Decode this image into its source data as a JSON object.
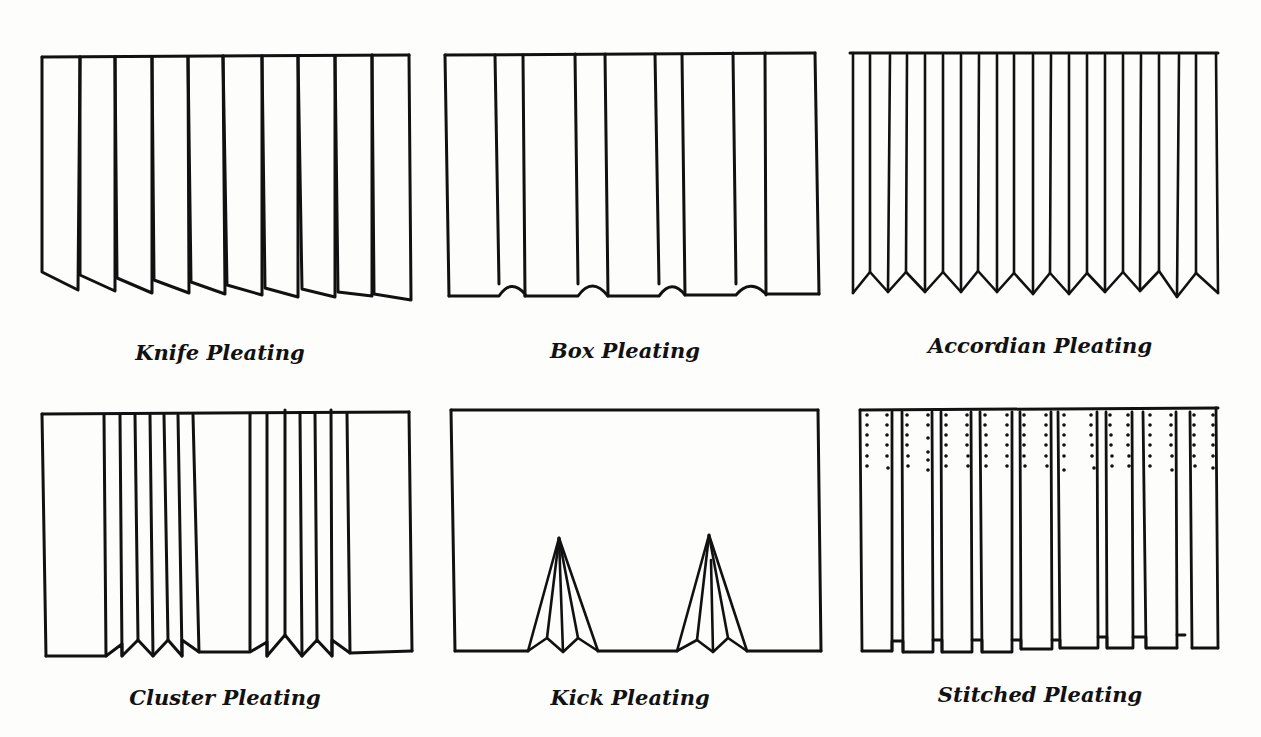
{
  "figure": {
    "ink_color": "#111111",
    "paper_color": "#fdfdfb"
  },
  "panels": [
    {
      "id": "knife",
      "caption": "Knife Pleating",
      "folds": 10
    },
    {
      "id": "box",
      "caption": "Box Pleating",
      "box_pleats": 4
    },
    {
      "id": "accordian",
      "caption": "Accordian Pleating",
      "folds": 20
    },
    {
      "id": "cluster",
      "caption": "Cluster Pleating",
      "clusters": 2,
      "folds_per_cluster": 6
    },
    {
      "id": "kick",
      "caption": "Kick Pleating",
      "kick_pleats": 2
    },
    {
      "id": "stitched",
      "caption": "Stitched Pleating",
      "folds": 9
    }
  ]
}
